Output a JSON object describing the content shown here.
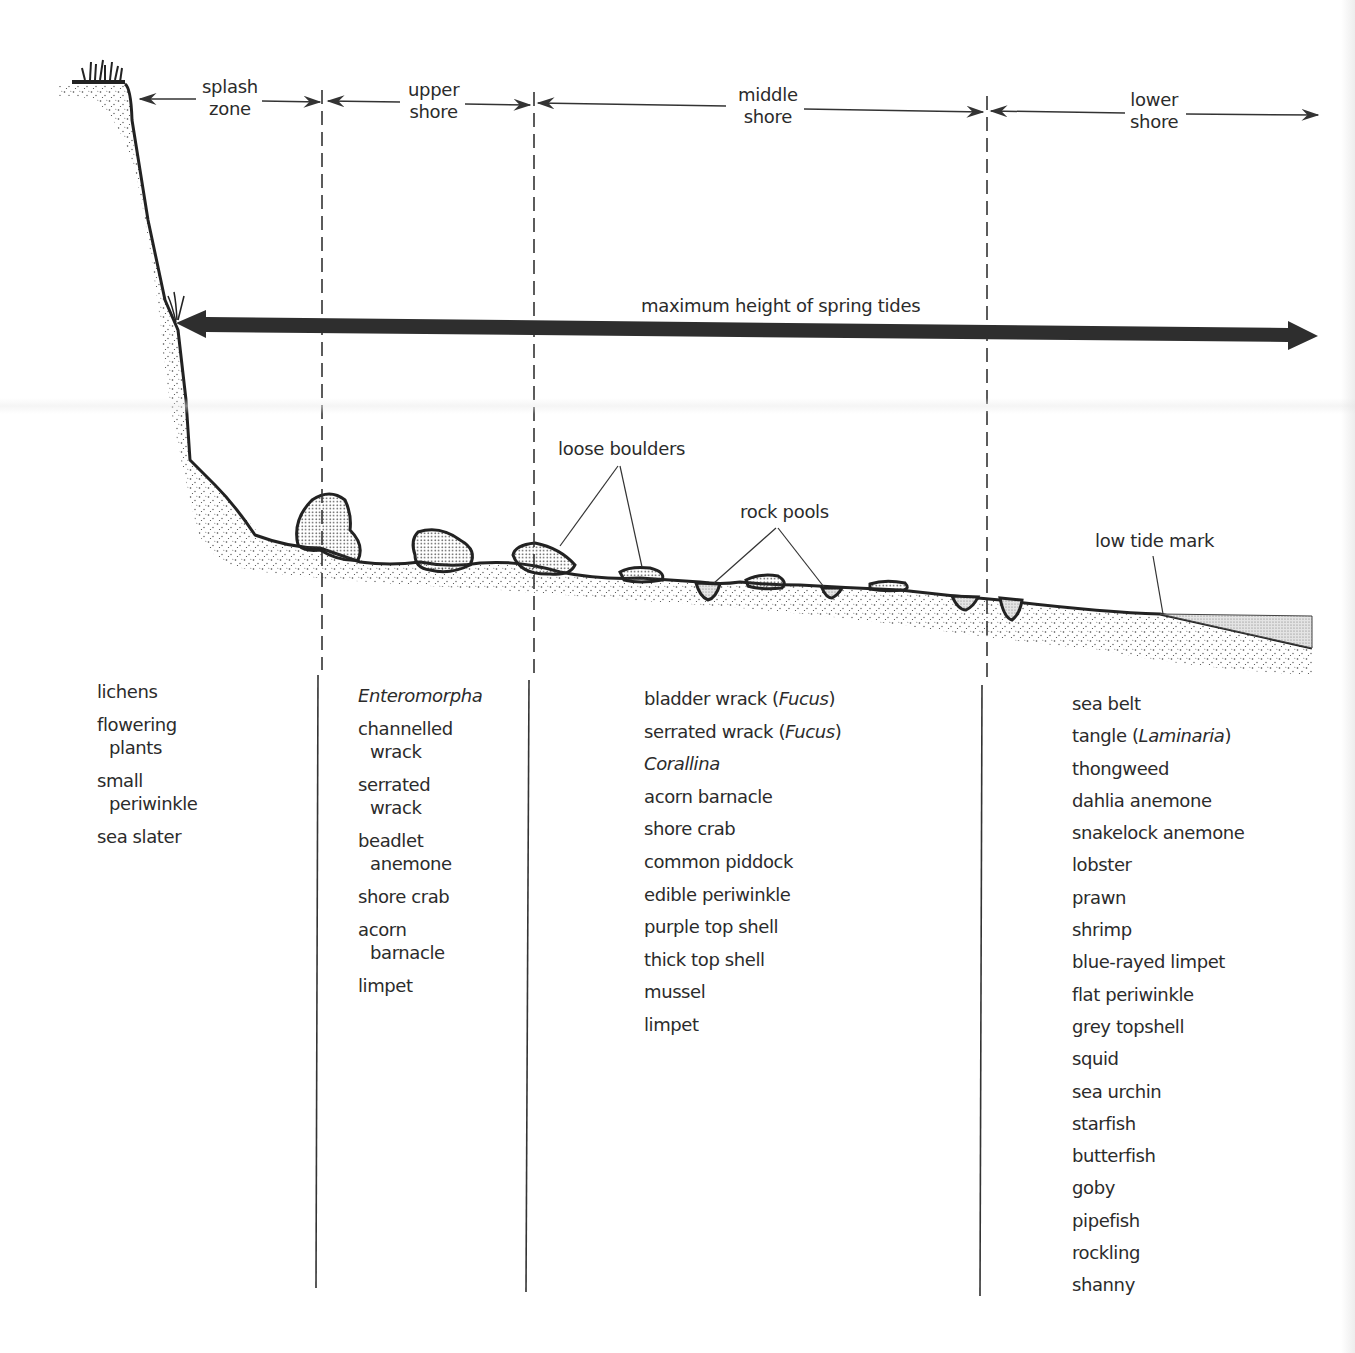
{
  "zones": [
    {
      "id": "splash",
      "line1": "splash",
      "line2": "zone"
    },
    {
      "id": "upper",
      "line1": "upper",
      "line2": "shore"
    },
    {
      "id": "middle",
      "line1": "middle",
      "line2": "shore"
    },
    {
      "id": "lower",
      "line1": "lower",
      "line2": "shore"
    }
  ],
  "annotations": {
    "spring_tides": "maximum height of spring tides",
    "loose_boulders": "loose boulders",
    "rock_pools": "rock pools",
    "low_tide": "low tide mark"
  },
  "species": {
    "splash": [
      {
        "l1": "lichens"
      },
      {
        "l1": "flowering",
        "l2": "plants"
      },
      {
        "l1": "small",
        "l2": "periwinkle"
      },
      {
        "l1": "sea slater"
      }
    ],
    "upper": [
      {
        "italic": "Enteromorpha"
      },
      {
        "l1": "channelled",
        "l2": "wrack"
      },
      {
        "l1": "serrated",
        "l2": "wrack"
      },
      {
        "l1": "beadlet",
        "l2": "anemone"
      },
      {
        "l1": "shore crab"
      },
      {
        "l1": "acorn",
        "l2": "barnacle"
      },
      {
        "l1": "limpet"
      }
    ],
    "middle": [
      {
        "pre": "bladder wrack (",
        "italic": "Fucus",
        "post": ")"
      },
      {
        "pre": "serrated wrack (",
        "italic": "Fucus",
        "post": ")"
      },
      {
        "italic": "Corallina"
      },
      {
        "l1": "acorn barnacle"
      },
      {
        "l1": "shore crab"
      },
      {
        "l1": "common piddock"
      },
      {
        "l1": "edible periwinkle"
      },
      {
        "l1": "purple top shell"
      },
      {
        "l1": "thick top shell"
      },
      {
        "l1": "mussel"
      },
      {
        "l1": "limpet"
      }
    ],
    "lower": [
      {
        "l1": "sea belt"
      },
      {
        "pre": "tangle (",
        "italic": "Laminaria",
        "post": ")"
      },
      {
        "l1": "thongweed"
      },
      {
        "l1": "dahlia anemone"
      },
      {
        "l1": "snakelock anemone"
      },
      {
        "l1": "lobster"
      },
      {
        "l1": "prawn"
      },
      {
        "l1": "shrimp"
      },
      {
        "l1": "blue-rayed limpet"
      },
      {
        "l1": "flat periwinkle"
      },
      {
        "l1": "grey topshell"
      },
      {
        "l1": "squid"
      },
      {
        "l1": "sea urchin"
      },
      {
        "l1": "starfish"
      },
      {
        "l1": "butterfish"
      },
      {
        "l1": "goby"
      },
      {
        "l1": "pipefish"
      },
      {
        "l1": "rockling"
      },
      {
        "l1": "shanny"
      }
    ]
  },
  "colors": {
    "ink": "#2b2b2b",
    "arrow": "#333333",
    "stipple": "#555555"
  }
}
